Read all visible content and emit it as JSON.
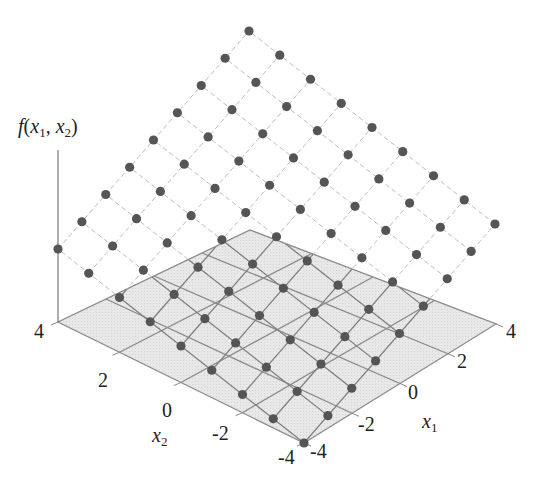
{
  "chart_data": {
    "type": "scatter",
    "subtype": "3d-surface-points",
    "title": "",
    "zlabel": "f(x1, x2)",
    "xlabel": "x1",
    "ylabel": "x2",
    "x1_ticks": [
      "-4",
      "-2",
      "0",
      "2",
      "4"
    ],
    "x2_ticks": [
      "-4",
      "-2",
      "0",
      "2",
      "4"
    ],
    "x1_range": [
      -4,
      4
    ],
    "x2_range": [
      -4,
      4
    ],
    "grid_points": {
      "x1": [
        -4,
        -3,
        -2,
        -1,
        0,
        1,
        2,
        3,
        4
      ],
      "x2": [
        -4,
        -3,
        -2,
        -1,
        0,
        1,
        2,
        3,
        4
      ],
      "description": "9x9 grid of points lying on a tilted plane f(x1,x2) increasing linearly in both x1 and x2; minimum at (-4,-4) touching the base plane, maximum at (4,4)"
    },
    "base_plane": {
      "z": 0,
      "grid_lines_every": 2,
      "fill": "#e6e6e6"
    },
    "colors": {
      "point": "#555555",
      "plane_fill": "#e4e4e4",
      "plane_lines": "#8a8a8a",
      "dashed": "#bdbdbd"
    }
  },
  "labels": {
    "f_main": "f",
    "f_open": "(",
    "x1_var": "x",
    "x1_sub": "1",
    "comma": ", ",
    "x2_var": "x",
    "x2_sub": "2",
    "f_close": ")",
    "x1_axis_var": "x",
    "x1_axis_sub": "1",
    "x2_axis_var": "x",
    "x2_axis_sub": "2"
  },
  "geometry": {
    "plane": {
      "c00": [
        304,
        443
      ],
      "c80": [
        496,
        324
      ],
      "c08": [
        58,
        322
      ],
      "c88": [
        250,
        230
      ]
    },
    "surface": {
      "c00": [
        304,
        443
      ],
      "c80": [
        495,
        224
      ],
      "c08": [
        58,
        249
      ],
      "c88": [
        249,
        31
      ]
    },
    "z_axis": {
      "x": 58,
      "y_top": 150,
      "y_bottom": 322
    }
  }
}
